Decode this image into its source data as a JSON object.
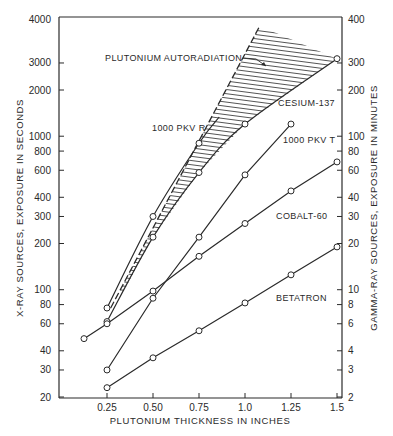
{
  "chart_data": {
    "type": "line",
    "title": "",
    "xlabel": "PLUTONIUM THICKNESS IN INCHES",
    "ylabel_left": "X-RAY SOURCES, EXPOSURE IN SECONDS",
    "ylabel_right": "GAMMA-RAY SOURCES, EXPOSURE IN MINUTES",
    "xscale": "linear",
    "yscale": "log",
    "xlim": [
      0.05,
      1.52
    ],
    "ylim_left": [
      20,
      4000
    ],
    "ylim_right": [
      2,
      400
    ],
    "grid": false,
    "legend": "inline labels",
    "x_ticks": [
      "0.25",
      "0.50",
      "0.75",
      "1.0",
      "1.25",
      "1.5"
    ],
    "x_tick_values": [
      0.25,
      0.5,
      0.75,
      1.0,
      1.25,
      1.5
    ],
    "y_ticks_left": [
      "4000",
      "3000",
      "2000",
      "1000",
      "800",
      "600",
      "400",
      "300",
      "200",
      "100",
      "80",
      "60",
      "40",
      "30",
      "20"
    ],
    "y_ticks_right": [
      "400",
      "300",
      "200",
      "100",
      "80",
      "60",
      "40",
      "30",
      "20",
      "10",
      "8",
      "6",
      "4",
      "3",
      "2"
    ],
    "series": [
      {
        "name": "1000 PKV R",
        "axis": "left (seconds)",
        "x": [
          0.25,
          0.5,
          0.75
        ],
        "y": [
          76,
          300,
          900
        ],
        "curve_extends_to": [
          0.86,
          1300
        ]
      },
      {
        "name": "CESIUM-137",
        "axis": "right (minutes)",
        "x": [
          0.25,
          0.5,
          0.75,
          1.0,
          1.5
        ],
        "y": [
          6.2,
          22,
          58,
          120,
          320
        ]
      },
      {
        "name": "1000 PKV T",
        "axis": "left (seconds)",
        "x": [
          0.25,
          0.5,
          0.75,
          1.0,
          1.25
        ],
        "y": [
          30,
          88,
          220,
          560,
          1200
        ]
      },
      {
        "name": "COBALT-60",
        "axis": "right (minutes)",
        "x": [
          0.125,
          0.25,
          0.5,
          0.75,
          1.0,
          1.25,
          1.5
        ],
        "y": [
          4.8,
          6.0,
          9.8,
          16.5,
          27,
          44,
          68
        ]
      },
      {
        "name": "BETATRON",
        "axis": "left (seconds)",
        "x": [
          0.25,
          0.5,
          0.75,
          1.0,
          1.25,
          1.5
        ],
        "y": [
          23,
          36,
          54,
          82,
          125,
          190
        ]
      },
      {
        "name": "PLUTONIUM AUTORADIATION",
        "axis": "left (seconds)",
        "style": "dashed boundary with hatched region above CESIUM-137",
        "x": [
          0.27,
          1.08
        ],
        "y": [
          76,
          3700
        ]
      }
    ],
    "annotations": [
      "PLUTONIUM AUTORADIATION",
      "1000 PKV R",
      "CESIUM-137",
      "1000 PKV T",
      "COBALT-60",
      "BETATRON"
    ]
  },
  "labels": {
    "autoradiation": "PLUTONIUM AUTORADIATION",
    "pkv_r": "1000 PKV R",
    "cesium": "CESIUM-137",
    "pkv_t": "1000 PKV T",
    "cobalt": "COBALT-60",
    "betatron": "BETATRON",
    "xlabel": "PLUTONIUM THICKNESS IN INCHES",
    "ylabel_left": "X-RAY SOURCES, EXPOSURE IN SECONDS",
    "ylabel_right": "GAMMA-RAY SOURCES, EXPOSURE IN MINUTES"
  },
  "colors": {
    "ink": "#2a2a2a",
    "background": "#ffffff"
  }
}
